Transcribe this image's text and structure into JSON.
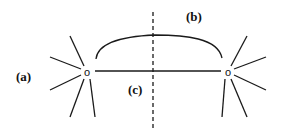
{
  "diagram": {
    "labels": {
      "a": "(a)",
      "b": "(b)",
      "c": "(c)"
    },
    "nodes": [
      {
        "id": "left",
        "glyph": "o",
        "x": 87,
        "y": 72
      },
      {
        "id": "right",
        "glyph": "o",
        "x": 228,
        "y": 72
      }
    ],
    "colors": {
      "line": "#1a1a1a",
      "background": "#ffffff"
    }
  }
}
